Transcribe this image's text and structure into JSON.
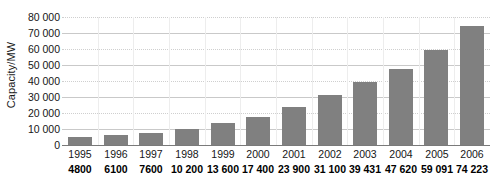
{
  "chart_data": {
    "type": "bar",
    "title": "",
    "xlabel": "",
    "ylabel": "Capacity/MW",
    "categories": [
      "1995",
      "1996",
      "1997",
      "1998",
      "1999",
      "2000",
      "2001",
      "2002",
      "2003",
      "2004",
      "2005",
      "2006"
    ],
    "values": [
      4800,
      6100,
      7600,
      10200,
      13600,
      17400,
      23900,
      31100,
      39431,
      47620,
      59091,
      74223
    ],
    "value_labels": [
      "4800",
      "6100",
      "7600",
      "10 200",
      "13 600",
      "17 400",
      "23 900",
      "31 100",
      "39 431",
      "47 620",
      "59 091",
      "74 223"
    ],
    "ylim": [
      0,
      80000
    ],
    "ytick_values": [
      0,
      10000,
      20000,
      30000,
      40000,
      50000,
      60000,
      70000,
      80000
    ],
    "ytick_labels": [
      "0",
      "10 000",
      "20 000",
      "30 000",
      "40 000",
      "50 000",
      "60 000",
      "70 000",
      "80 000"
    ],
    "grid": true,
    "legend": false,
    "bar_color": "#808080",
    "gridline_color": "#c9c9c9",
    "axis_color": "#7a7a7a",
    "text_color": "#161616"
  }
}
